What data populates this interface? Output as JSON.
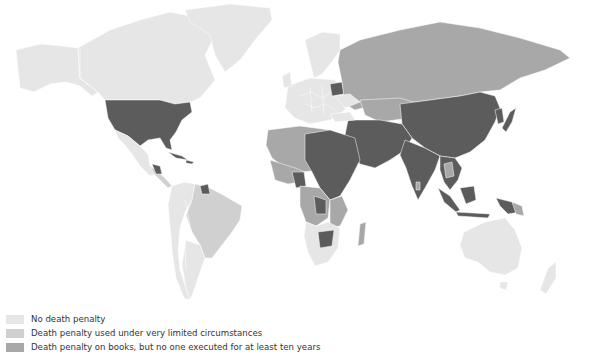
{
  "map": {
    "type": "choropleth-world",
    "colors": {
      "none": "#e6e6e6",
      "limited": "#d0d0d0",
      "books": "#a8a8a8",
      "active": "#5c5c5c",
      "border": "#555555"
    }
  },
  "legend": {
    "items": [
      {
        "label": "No death penalty",
        "color": "#e6e6e6"
      },
      {
        "label": "Death penalty used under very limited circumstances",
        "color": "#d0d0d0"
      },
      {
        "label": "Death penalty on books, but no one executed for at least ten years",
        "color": "#a8a8a8"
      }
    ]
  }
}
